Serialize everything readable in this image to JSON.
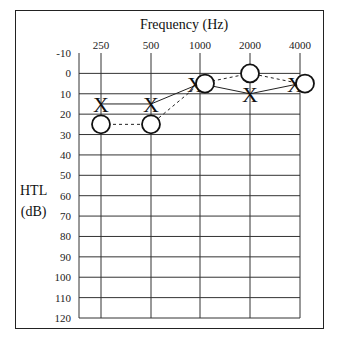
{
  "chart_data": {
    "type": "line",
    "title": "Frequency (Hz)",
    "xlabel": "Frequency (Hz)",
    "ylabel": "HTL (dB)",
    "ylabel_lines": [
      "HTL",
      "(dB)"
    ],
    "categories": [
      "250",
      "500",
      "1000",
      "2000",
      "4000"
    ],
    "y_ticks": [
      "-10",
      "0",
      "10",
      "20",
      "30",
      "40",
      "50",
      "60",
      "70",
      "80",
      "90",
      "100",
      "110",
      "120"
    ],
    "ylim": [
      -10,
      120
    ],
    "y_inverted": true,
    "grid": true,
    "series": [
      {
        "name": "X (left ear)",
        "marker": "X",
        "line": "solid",
        "values": [
          15,
          15,
          5,
          10,
          5
        ]
      },
      {
        "name": "O (right ear)",
        "marker": "O",
        "line": "dashed",
        "values": [
          25,
          25,
          5,
          0,
          5
        ]
      }
    ]
  }
}
